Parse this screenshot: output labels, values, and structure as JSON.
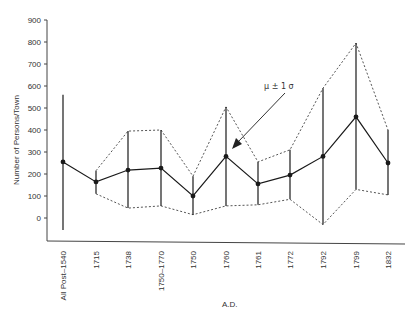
{
  "chart_data": {
    "type": "line",
    "title": "",
    "xlabel": "A.D.",
    "ylabel": "Number of Persons/Town",
    "ylim": [
      -100,
      900
    ],
    "yticks": [
      0,
      100,
      200,
      300,
      400,
      500,
      600,
      700,
      800,
      900
    ],
    "grid": false,
    "legend": null,
    "categories": [
      "All Post–1540",
      "1715",
      "1738",
      "1750–1770",
      "1750",
      "1760",
      "1761",
      "1772",
      "1792",
      "1799",
      "1832"
    ],
    "series": [
      {
        "name": "Mean",
        "style": "solid line with markers",
        "values": [
          255,
          164,
          218,
          227,
          100,
          280,
          155,
          195,
          280,
          460,
          250
        ]
      },
      {
        "name": "Mean + 1 SD",
        "style": "dotted",
        "values": [
          560,
          215,
          395,
          400,
          190,
          505,
          255,
          310,
          590,
          795,
          400
        ]
      },
      {
        "name": "Mean - 1 SD",
        "style": "dotted",
        "values": [
          -55,
          110,
          45,
          55,
          15,
          55,
          60,
          85,
          -30,
          130,
          105
        ]
      }
    ],
    "annotations": [
      {
        "text": "μ ± 1 σ",
        "points_to": "1760",
        "arrow": true
      }
    ]
  },
  "labels": {
    "ylabel": "Number of Persons/Town",
    "xlabel": "A.D.",
    "annotation": "μ ± 1 σ"
  },
  "colors": {
    "line": "#1a1a1a",
    "dotted": "#555555",
    "axis": "#444444",
    "text": "#333333"
  }
}
